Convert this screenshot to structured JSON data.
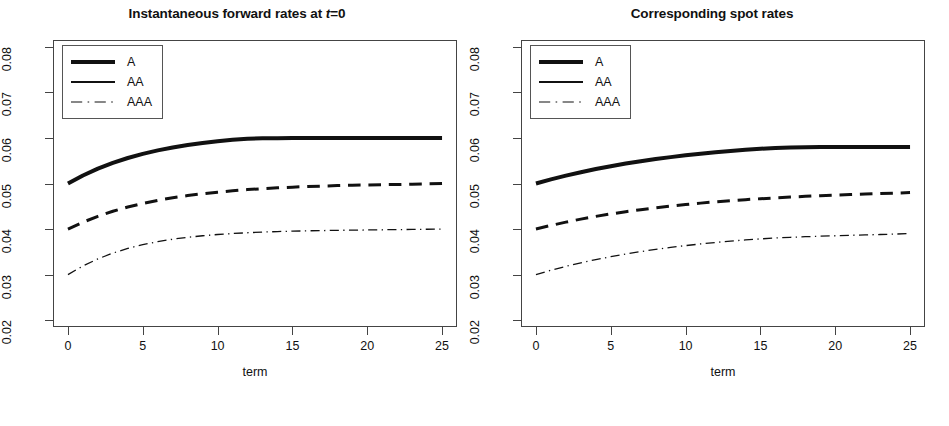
{
  "figure": {
    "width": 949,
    "height": 426,
    "background": "#ffffff",
    "line_color": "#111111",
    "axis_color": "#444444"
  },
  "panels": [
    {
      "id": "forward-rates",
      "title_prefix": "Instantaneous forward rates at ",
      "title_italic": "t",
      "title_suffix": "=0",
      "title_plain": "Instantaneous forward rates at t=0"
    },
    {
      "id": "spot-rates",
      "title_prefix": "Corresponding spot rates",
      "title_italic": "",
      "title_suffix": "",
      "title_plain": "Corresponding spot rates"
    }
  ],
  "legend": {
    "entries": [
      {
        "label": "A",
        "style": "solid",
        "width": 4.0
      },
      {
        "label": "AA",
        "style": "solid",
        "width": 2.2
      },
      {
        "label": "AAA",
        "style": "dashdot",
        "width": 1.1
      }
    ]
  },
  "chart_data": [
    {
      "type": "line",
      "title": "Instantaneous forward rates at t=0",
      "xlabel": "term",
      "ylabel": "",
      "xlim": [
        -1.0,
        26.0
      ],
      "ylim": [
        0.0185,
        0.0815
      ],
      "xticks": [
        0,
        5,
        10,
        15,
        20,
        25
      ],
      "yticks": [
        0.02,
        0.03,
        0.04,
        0.05,
        0.06,
        0.07,
        0.08
      ],
      "xticklabels": [
        "0",
        "5",
        "10",
        "15",
        "20",
        "25"
      ],
      "yticklabels": [
        "0.02",
        "0.03",
        "0.04",
        "0.05",
        "0.06",
        "0.07",
        "0.08"
      ],
      "grid": false,
      "legend_position": "top-left",
      "x": [
        0,
        1,
        2,
        3,
        4,
        5,
        6,
        7,
        8,
        9,
        10,
        11,
        12,
        13,
        14,
        15,
        16,
        17,
        18,
        19,
        20,
        21,
        22,
        23,
        24,
        25
      ],
      "series": [
        {
          "name": "A",
          "style": "solid",
          "linewidth": 4.0,
          "values": [
            0.05,
            0.05175,
            0.05325,
            0.05452,
            0.0556,
            0.05651,
            0.05727,
            0.05791,
            0.05845,
            0.05889,
            0.05927,
            0.05958,
            0.05982,
            0.05992,
            0.05996,
            0.05998,
            0.05999,
            0.06,
            0.06,
            0.06,
            0.06,
            0.06,
            0.06,
            0.06,
            0.06,
            0.06
          ]
        },
        {
          "name": "AA",
          "style": "dashed",
          "linewidth": 3.0,
          "values": [
            0.04,
            0.0415,
            0.0428,
            0.0439,
            0.04484,
            0.04563,
            0.0463,
            0.04687,
            0.04735,
            0.04775,
            0.0481,
            0.0484,
            0.04866,
            0.04887,
            0.04905,
            0.0492,
            0.04933,
            0.04944,
            0.04954,
            0.04962,
            0.04968,
            0.04974,
            0.04979,
            0.04985,
            0.04992,
            0.05
          ]
        },
        {
          "name": "AAA",
          "style": "dashdot",
          "linewidth": 1.3,
          "values": [
            0.03,
            0.0319,
            0.03345,
            0.03472,
            0.03575,
            0.03658,
            0.03724,
            0.03777,
            0.03819,
            0.03853,
            0.0388,
            0.03902,
            0.03919,
            0.03933,
            0.03945,
            0.03954,
            0.03961,
            0.03967,
            0.03972,
            0.03976,
            0.0398,
            0.03984,
            0.03988,
            0.03992,
            0.03996,
            0.04
          ]
        }
      ]
    },
    {
      "type": "line",
      "title": "Corresponding spot rates",
      "xlabel": "term",
      "ylabel": "",
      "xlim": [
        -1.0,
        26.0
      ],
      "ylim": [
        0.0185,
        0.0815
      ],
      "xticks": [
        0,
        5,
        10,
        15,
        20,
        25
      ],
      "yticks": [
        0.02,
        0.03,
        0.04,
        0.05,
        0.06,
        0.07,
        0.08
      ],
      "xticklabels": [
        "0",
        "5",
        "10",
        "15",
        "20",
        "25"
      ],
      "yticklabels": [
        "0.02",
        "0.03",
        "0.04",
        "0.05",
        "0.06",
        "0.07",
        "0.08"
      ],
      "grid": false,
      "legend_position": "top-left",
      "x": [
        0,
        1,
        2,
        3,
        4,
        5,
        6,
        7,
        8,
        9,
        10,
        11,
        12,
        13,
        14,
        15,
        16,
        17,
        18,
        19,
        20,
        21,
        22,
        23,
        24,
        25
      ],
      "series": [
        {
          "name": "A",
          "style": "solid",
          "linewidth": 4.0,
          "values": [
            0.05,
            0.0509,
            0.05172,
            0.05248,
            0.05317,
            0.0538,
            0.05437,
            0.05489,
            0.05536,
            0.05579,
            0.05618,
            0.05653,
            0.05685,
            0.05714,
            0.0574,
            0.05763,
            0.05779,
            0.0579,
            0.05797,
            0.05799,
            0.058,
            0.058,
            0.058,
            0.058,
            0.058,
            0.058
          ]
        },
        {
          "name": "AA",
          "style": "dashed",
          "linewidth": 3.0,
          "values": [
            0.04,
            0.0408,
            0.04152,
            0.04218,
            0.04278,
            0.04332,
            0.04381,
            0.04426,
            0.04467,
            0.04504,
            0.04538,
            0.04569,
            0.04597,
            0.04622,
            0.04645,
            0.04666,
            0.04685,
            0.04702,
            0.04718,
            0.04732,
            0.04745,
            0.04757,
            0.04768,
            0.04778,
            0.04789,
            0.048
          ]
        },
        {
          "name": "AAA",
          "style": "dashdot",
          "linewidth": 1.3,
          "values": [
            0.03,
            0.03095,
            0.03181,
            0.03259,
            0.0333,
            0.03394,
            0.03452,
            0.03505,
            0.03553,
            0.03597,
            0.03637,
            0.03673,
            0.03706,
            0.03735,
            0.03761,
            0.03784,
            0.03803,
            0.03819,
            0.03832,
            0.03843,
            0.03853,
            0.03862,
            0.03871,
            0.0388,
            0.0389,
            0.039
          ]
        }
      ]
    }
  ]
}
